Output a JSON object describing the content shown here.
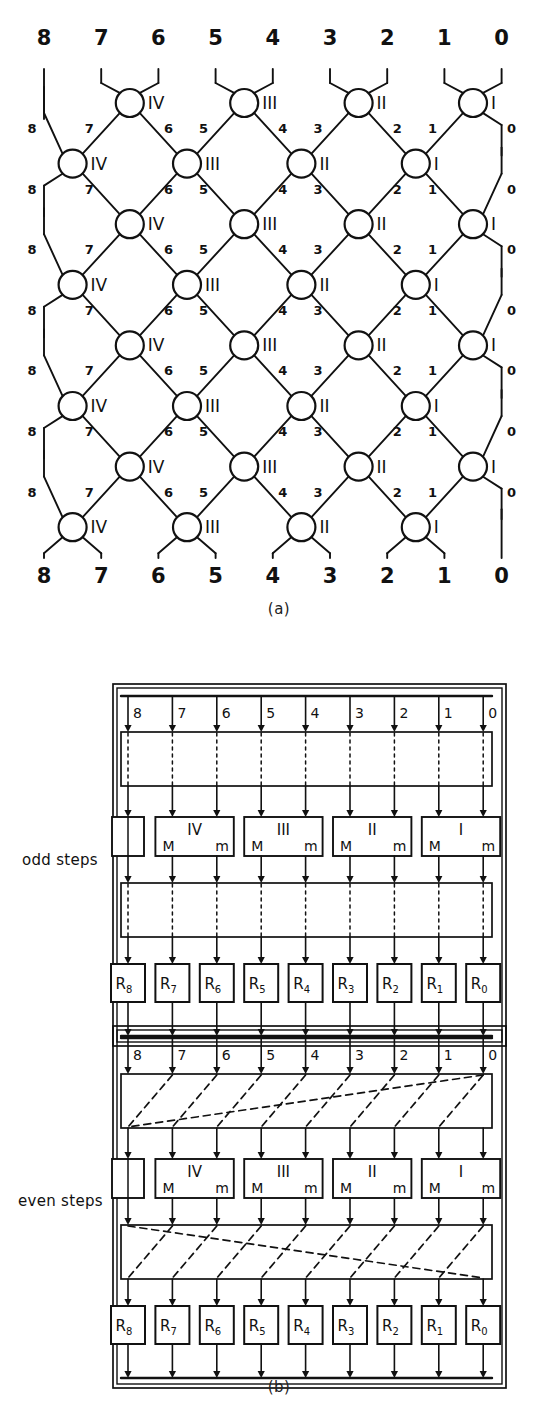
{
  "figure": {
    "caption_a": "(a)",
    "caption_b": "(b)"
  },
  "network": {
    "type": "odd-even-transposition-sorting-network",
    "top_labels": [
      "8",
      "7",
      "6",
      "5",
      "4",
      "3",
      "2",
      "1",
      "0"
    ],
    "bottom_labels": [
      "8",
      "7",
      "6",
      "5",
      "4",
      "3",
      "2",
      "1",
      "0"
    ],
    "node_labels_odd_rows": [
      "IV",
      "III",
      "II",
      "I"
    ],
    "node_labels_even_rows": [
      "IV",
      "III",
      "II",
      "I"
    ],
    "edge_labels": [
      "8",
      "7",
      "6",
      "5",
      "4",
      "3",
      "2",
      "1",
      "0"
    ],
    "rows": 8,
    "columns": 9
  },
  "odd_block": {
    "label": "odd steps",
    "bus_labels": [
      "8",
      "7",
      "6",
      "5",
      "4",
      "3",
      "2",
      "1",
      "0"
    ],
    "modules": [
      {
        "name": "",
        "left": "",
        "right": ""
      },
      {
        "name": "IV",
        "left": "M",
        "right": "m"
      },
      {
        "name": "III",
        "left": "M",
        "right": "m"
      },
      {
        "name": "II",
        "left": "M",
        "right": "m"
      },
      {
        "name": "I",
        "left": "M",
        "right": "m"
      }
    ],
    "registers": [
      "R8",
      "R7",
      "R6",
      "R5",
      "R4",
      "R3",
      "R2",
      "R1",
      "R0"
    ],
    "register_base": "R",
    "register_subscripts": [
      "8",
      "7",
      "6",
      "5",
      "4",
      "3",
      "2",
      "1",
      "0"
    ],
    "interconnect": "straight"
  },
  "even_block": {
    "label": "even steps",
    "bus_labels": [
      "8",
      "7",
      "6",
      "5",
      "4",
      "3",
      "2",
      "1",
      "0"
    ],
    "modules": [
      {
        "name": "",
        "left": "",
        "right": ""
      },
      {
        "name": "IV",
        "left": "M",
        "right": "m"
      },
      {
        "name": "III",
        "left": "M",
        "right": "m"
      },
      {
        "name": "II",
        "left": "M",
        "right": "m"
      },
      {
        "name": "I",
        "left": "M",
        "right": "m"
      }
    ],
    "registers": [
      "R8",
      "R7",
      "R6",
      "R5",
      "R4",
      "R3",
      "R2",
      "R1",
      "R0"
    ],
    "register_base": "R",
    "register_subscripts": [
      "8",
      "7",
      "6",
      "5",
      "4",
      "3",
      "2",
      "1",
      "0"
    ],
    "interconnect": "shifted"
  },
  "colors": {
    "ink": "#111111",
    "background": "#ffffff"
  }
}
